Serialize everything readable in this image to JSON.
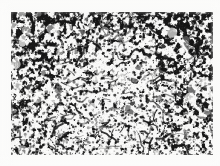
{
  "image": {
    "kind": "scanned-micrograph",
    "caption": "",
    "width": 220,
    "height": 166,
    "background_color": "#fbfbfa",
    "plate_background_color": "#fdfdfc",
    "ink_color": "#141414",
    "midtone_color": "#6e6e6e",
    "plate": {
      "left": 11,
      "top": 12,
      "width": 202,
      "height": 143
    },
    "texture": {
      "description": "dense irregular reticulated mottled black-on-white grain",
      "pattern": "threshold-noise",
      "base_cell": 3.1,
      "seed": 20251,
      "octaves": 4,
      "coverage_top": 0.52,
      "coverage_bottom": 0.33,
      "speck_count": 2300,
      "filament_count": 240,
      "contrast": 0.86
    }
  }
}
